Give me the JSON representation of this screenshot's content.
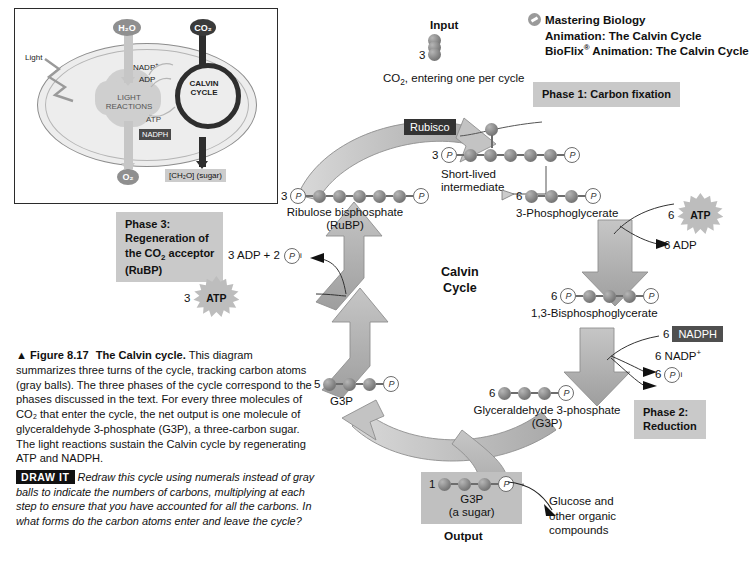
{
  "figure": {
    "number": "▲ Figure 8.17",
    "title": "The Calvin cycle.",
    "body": "This diagram summarizes three turns of the cycle, tracking carbon atoms (gray balls). The three phases of the cycle correspond to the phases discussed in the text. For every three molecules of CO₂ that enter the cycle, the net output is one molecule of glyceraldehyde 3-phosphate (G3P), a three-carbon sugar. The light reactions sustain the Calvin cycle by regenerating ATP and NADPH.",
    "draw_it_tag": "DRAW IT",
    "draw_it_body": "Redraw this cycle using numerals instead of gray balls to indicate the numbers of carbons, multiplying at each step to ensure that you have accounted for all the carbons. In what forms do the carbon atoms enter and leave the cycle?"
  },
  "mastering": {
    "icon": "media-circle-icon",
    "line1": "Mastering Biology",
    "line2": "Animation: The Calvin Cycle",
    "line3_pre": "BioFlix",
    "line3_sup": "®",
    "line3_post": " Animation: The Calvin Cycle"
  },
  "inset": {
    "h2o": "H₂O",
    "co2": "CO₂",
    "light": "Light",
    "light_reactions": "LIGHT\nREACTIONS",
    "calvin_cycle": "CALVIN\nCYCLE",
    "nadp_plus": "NADP⁺",
    "adp": "ADP",
    "atp": "ATP",
    "nadph": "NADPH",
    "o2": "O₂",
    "sugar": "[CH₂O] (sugar)"
  },
  "diagram": {
    "input_label": "Input",
    "input_count": "3",
    "co2_note": "CO₂, entering one per cycle",
    "rubisco": "Rubisco",
    "cycle_center_line1": "Calvin",
    "cycle_center_line2": "Cycle",
    "phase1": "Phase 1: Carbon fixation",
    "phase2": "Phase 2:\nReduction",
    "phase3": "Phase 3:\nRegeneration of\nthe CO₂ acceptor\n(RuBP)",
    "short_lived": "Short-lived\nintermediate",
    "output_label": "Output",
    "glucose_note": "Glucose and\nother organic\ncompounds",
    "molecules": [
      {
        "id": "rubp",
        "count": "3",
        "label": "Ribulose bisphosphate\n(RuBP)",
        "balls": 5,
        "p_left": true,
        "p_right": true
      },
      {
        "id": "intermediate",
        "count": "3",
        "label": "",
        "balls": 6,
        "p_left": true,
        "p_right": true
      },
      {
        "id": "3pg",
        "count": "6",
        "label": "3-Phosphoglycerate",
        "balls": 3,
        "p_left": false,
        "p_right": true
      },
      {
        "id": "bpg",
        "count": "6",
        "label": "1,3-Bisphosphoglycerate",
        "balls": 3,
        "p_left": true,
        "p_right": true
      },
      {
        "id": "g3p6",
        "count": "6",
        "label": "Glyceraldehyde 3-phosphate\n(G3P)",
        "balls": 3,
        "p_left": false,
        "p_right": true
      },
      {
        "id": "g3p5",
        "count": "5",
        "label": "G3P",
        "balls": 3,
        "p_left": false,
        "p_right": true
      },
      {
        "id": "g3p1",
        "count": "1",
        "label": "G3P\n(a sugar)",
        "balls": 3,
        "p_left": false,
        "p_right": true
      }
    ],
    "cofactors": [
      {
        "id": "atp6",
        "count": "6",
        "name": "ATP",
        "style": "star"
      },
      {
        "id": "adp6",
        "count": "6",
        "name": "ADP",
        "style": "plain"
      },
      {
        "id": "nadph6",
        "count": "6",
        "name": "NADPH",
        "style": "tag"
      },
      {
        "id": "nadp6",
        "count": "6",
        "name": "NADP⁺",
        "style": "plain"
      },
      {
        "id": "pi6",
        "count": "6",
        "name": "Pᵢ",
        "style": "pcircle"
      },
      {
        "id": "atp3",
        "count": "3",
        "name": "ATP",
        "style": "star"
      },
      {
        "id": "adp3",
        "count": "3",
        "name": "3 ADP + 2 Pᵢ",
        "style": "plain"
      }
    ],
    "adp_pi_text": "3 ADP + 2",
    "adp_pi_sub": "i"
  },
  "colors": {
    "ball": "#7d7d7d",
    "phase_box": "#c9c9c9",
    "nadph_tag": "#4f4f4f",
    "rubisco_tag": "#333333",
    "arrow_grey": "#a8a8a8",
    "output_box": "#c0c0c0"
  }
}
